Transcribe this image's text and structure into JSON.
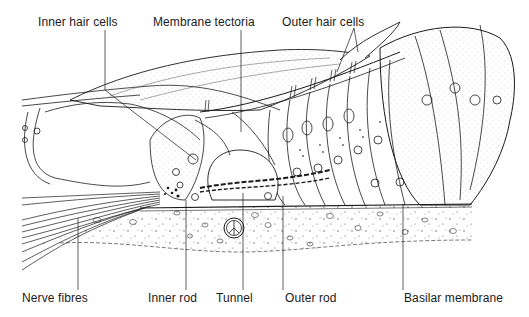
{
  "diagram": {
    "labels_top": [
      {
        "id": "inner-hair-cells",
        "text": "Inner hair cells",
        "x": 38,
        "y": 15
      },
      {
        "id": "membrane-tectoria",
        "text": "Membrane tectoria",
        "x": 153,
        "y": 15
      },
      {
        "id": "outer-hair-cells",
        "text": "Outer hair cells",
        "x": 282,
        "y": 15
      }
    ],
    "labels_bottom": [
      {
        "id": "nerve-fibres",
        "text": "Nerve fibres",
        "x": 22,
        "y": 291
      },
      {
        "id": "inner-rod",
        "text": "Inner rod",
        "x": 148,
        "y": 291
      },
      {
        "id": "tunnel",
        "text": "Tunnel",
        "x": 216,
        "y": 291
      },
      {
        "id": "outer-rod",
        "text": "Outer rod",
        "x": 285,
        "y": 291
      },
      {
        "id": "basilar-membrane",
        "text": "Basilar membrane",
        "x": 404,
        "y": 291
      }
    ],
    "colors": {
      "ink": "#1a1a1a",
      "stipple": "#8a8a8a",
      "background": "#ffffff"
    }
  }
}
